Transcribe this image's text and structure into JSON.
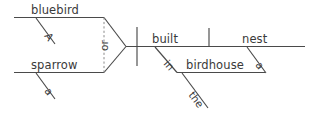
{
  "diagram": {
    "type": "reed-kellogg-sentence-diagram",
    "sentence": "A bluebird or sparrow built the nest in the birdhouse",
    "ink_color": "#4a4a4a",
    "dashed_color": "#8a8a8a",
    "background": "#ffffff",
    "subject_compound": {
      "conjunction": "or",
      "branches": [
        {
          "id": "branch-top",
          "noun": "bluebird",
          "modifiers": [
            {
              "word": "A",
              "role": "article"
            }
          ]
        },
        {
          "id": "branch-bottom",
          "noun": "sparrow",
          "modifiers": [
            {
              "word": "a",
              "role": "article"
            }
          ]
        }
      ]
    },
    "predicate": {
      "verb": "built",
      "direct_object": "nest",
      "object_modifiers": [
        {
          "word": "a",
          "role": "article"
        }
      ],
      "prepositional_phrase": {
        "preposition": "in",
        "object": "birdhouse",
        "object_modifiers": [
          {
            "word": "the",
            "role": "article"
          }
        ]
      }
    }
  }
}
